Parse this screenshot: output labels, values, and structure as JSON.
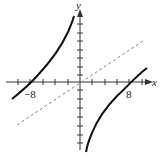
{
  "figure": {
    "type": "function-graph",
    "x_axis_label": "x",
    "y_axis_label": "y",
    "x_tick_labels": [
      {
        "value": -8,
        "text": "−8"
      },
      {
        "value": 8,
        "text": "8"
      }
    ],
    "x_tick_step": 2,
    "curve_description": "Hyperbola with vertical asymptote at x=0, crossing x-axis at -8 and 8",
    "asymptote_style": "dashed",
    "colors": {
      "curve": "#111111",
      "axes": "#333333",
      "asymptote": "#888888",
      "background": "#ffffff"
    }
  }
}
